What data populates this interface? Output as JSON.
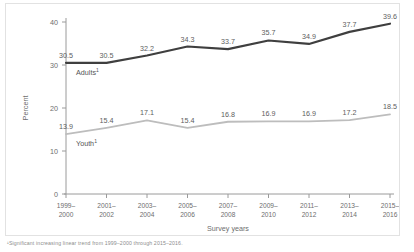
{
  "chart_data": {
    "type": "line",
    "title": "",
    "xlabel": "Survey years",
    "ylabel": "Percent",
    "ylim": [
      0,
      40
    ],
    "yticks": [
      0,
      10,
      20,
      30,
      40
    ],
    "grid": false,
    "legend": "inline-labels",
    "categories": [
      "1999–\n2000",
      "2001–\n2002",
      "2003–\n2004",
      "2005–\n2006",
      "2007–\n2008",
      "2009–\n2010",
      "2011–\n2012",
      "2013–\n2014",
      "2015–\n2016"
    ],
    "category_lines": [
      [
        "1999–",
        "2000"
      ],
      [
        "2001–",
        "2002"
      ],
      [
        "2003–",
        "2004"
      ],
      [
        "2005–",
        "2006"
      ],
      [
        "2007–",
        "2008"
      ],
      [
        "2009–",
        "2010"
      ],
      [
        "2011–",
        "2012"
      ],
      [
        "2013–",
        "2014"
      ],
      [
        "2015–",
        "2016"
      ]
    ],
    "series": [
      {
        "name": "Adults",
        "footnote_marker": "1",
        "color": "#3f3f3f",
        "values": [
          30.5,
          30.5,
          32.2,
          34.3,
          33.7,
          35.7,
          34.9,
          37.7,
          39.6
        ]
      },
      {
        "name": "Youth",
        "footnote_marker": "1",
        "color": "#bdbdbd",
        "values": [
          13.9,
          15.4,
          17.1,
          15.4,
          16.8,
          16.9,
          16.9,
          17.2,
          18.5
        ]
      }
    ],
    "annotations": []
  },
  "footnote": {
    "text": "¹Significant increasing linear trend from 1999–2000 through 2015–2016."
  },
  "axis": {
    "y_title": "Percent",
    "x_title": "Survey years"
  },
  "colors": {
    "adults_line": "#3f3f3f",
    "youth_line": "#bdbdbd",
    "axis": "#9a9a9a",
    "text": "#6e6e6e",
    "frame": "#e2e2e2"
  }
}
